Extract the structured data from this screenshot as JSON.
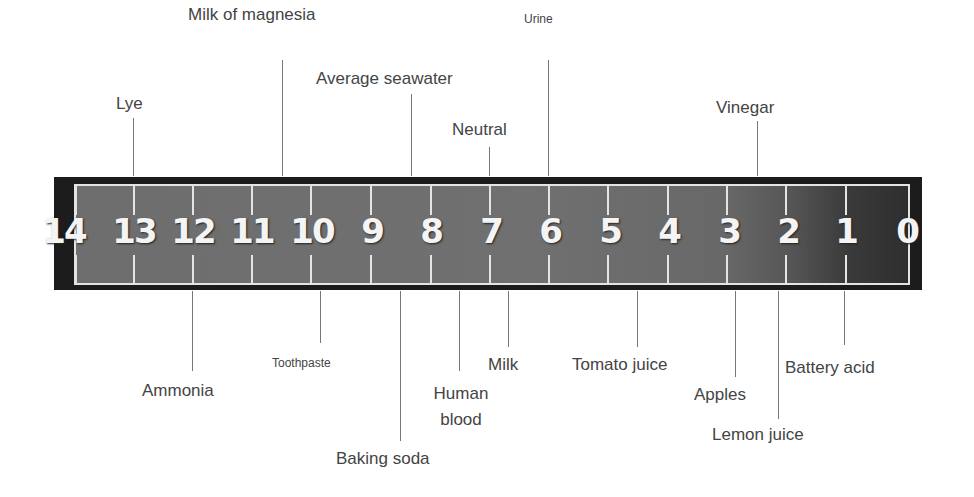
{
  "scale": {
    "numbers": [
      "14",
      "13",
      "12",
      "11",
      "10",
      "9",
      "8",
      "7",
      "6",
      "5",
      "4",
      "3",
      "2",
      "1",
      "0"
    ]
  },
  "labels_top": [
    {
      "text": "Lye",
      "ph": 13
    },
    {
      "text": "Milk of magnesia",
      "ph": 10.5
    },
    {
      "text": "Average seawater",
      "ph": 8
    },
    {
      "text": "Neutral",
      "ph": 7
    },
    {
      "text": "Urine",
      "ph": 6
    },
    {
      "text": "Vinegar",
      "ph": 2.5
    }
  ],
  "labels_bottom": [
    {
      "text": "Ammonia",
      "ph": 12
    },
    {
      "text": "Toothpaste",
      "ph": 9.8
    },
    {
      "text": "Baking soda",
      "ph": 8.5
    },
    {
      "text": "Human blood",
      "ph": 7.5
    },
    {
      "text": "Milk",
      "ph": 6.7
    },
    {
      "text": "Tomato juice",
      "ph": 4.5
    },
    {
      "text": "Apples",
      "ph": 3
    },
    {
      "text": "Lemon juice",
      "ph": 2.2
    },
    {
      "text": "Battery acid",
      "ph": 1
    }
  ]
}
